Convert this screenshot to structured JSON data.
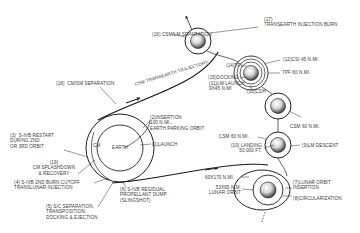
{
  "diagram": {
    "bodies": {
      "earth_label": "EARTH",
      "cm_label": "CM"
    },
    "trajectories": {
      "outbound": "",
      "return": "CSM TRANSEARTH TRAJECTORY"
    },
    "events": [
      {
        "id": "1",
        "label": "(1)LAUNCH"
      },
      {
        "id": "2",
        "label": "(2)INSERTION\n100 N.MI.,\nEARTH PARKING ORBIT"
      },
      {
        "id": "3",
        "label": "(3)  S-IVB RESTART\nDURING 2ND\nOR 3RD ORBIT"
      },
      {
        "id": "4",
        "label": "(4) S-IVB 2ND BURN CUTOFF\nTRANSLUNAR INJECTION"
      },
      {
        "id": "5",
        "label": "(5) S/C SEPARATION,\nTRANSPOSITION,\nDOCKING & EJECTION"
      },
      {
        "id": "6",
        "label": "(6) S-IVB RESIDUAL\nPROPELLANT DUMP\n(SLINGSHOT)"
      },
      {
        "id": "7",
        "label": "(7)LUNAR ORBIT\nINSERTION"
      },
      {
        "id": "8",
        "label": "(8)CIRCULARIZATION"
      },
      {
        "id": "9",
        "label": "(9)LM DESCENT"
      },
      {
        "id": "10",
        "label": "(10) LANDING\n50,000 FT."
      },
      {
        "id": "11",
        "label": "(11)LM LAUNCH\n9x45 N.MI"
      },
      {
        "id": "12",
        "label": "(12)CSI 45 N.MI."
      },
      {
        "id": "13",
        "label": "(13)CDH"
      },
      {
        "id": "14",
        "label": "(14)TPI"
      },
      {
        "id": "15",
        "label": "(15)DOCKING"
      },
      {
        "id": "16",
        "label": "(16) CSM/LM SEPARATION"
      },
      {
        "id": "17",
        "label": "(17)\nTRANSEARTH INJECTION BURN"
      },
      {
        "id": "18",
        "label": "(18)  CM/SM SEPARATION"
      },
      {
        "id": "19",
        "label": "(19)\nCM SPLASHDOWN\n& RECOVERY"
      }
    ],
    "orbit_notes": {
      "tpf": "TPF 60 N.MI.",
      "csm60_upper": "CSM 60 N.MI.",
      "csm60_lower": "CSM 60 N.MI.",
      "ellipse": "60x170 N.MI.",
      "lunar_orbit": "53x65 N.M.\nLUNAR ORBIT"
    }
  }
}
